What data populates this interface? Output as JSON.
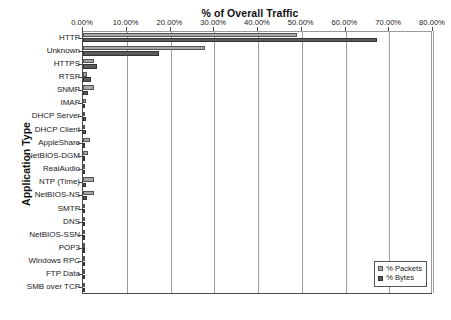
{
  "chart_data": {
    "type": "bar",
    "orientation": "horizontal",
    "title": "% of Overall Traffic",
    "xlabel": "% of Overall Traffic",
    "ylabel": "Application Type",
    "xlim": [
      0,
      80
    ],
    "grid": true,
    "legend_position": "bottom-right",
    "xtick_labels": [
      "0.00%",
      "10.00%",
      "20.00%",
      "30.00%",
      "40.00%",
      "50.00%",
      "60.00%",
      "70.00%",
      "80.00%"
    ],
    "xtick_values": [
      0,
      10,
      20,
      30,
      40,
      50,
      60,
      70,
      80
    ],
    "categories": [
      "HTTP",
      "Unknown",
      "HTTPS",
      "RTSP",
      "SNMP",
      "IMAP",
      "DHCP Server",
      "DHCP Client",
      "AppleShare",
      "NetBIOS-DGM",
      "RealAudio",
      "NTP (Time)",
      "NetBIOS-NS",
      "SMTP",
      "DNS",
      "NetBIOS-SSN",
      "POP3",
      "Windows RPC",
      "FTP Data",
      "SMB over TCP"
    ],
    "series": [
      {
        "name": "% Packets",
        "color": "#a8a8a8",
        "values": [
          48.8,
          27.8,
          2.6,
          0.9,
          2.4,
          0.7,
          0.5,
          0.5,
          1.6,
          1.1,
          0.4,
          2.4,
          2.6,
          0.3,
          0.3,
          0.2,
          0.2,
          0.2,
          0.15,
          0.15
        ]
      },
      {
        "name": "% Bytes",
        "color": "#5c5c5c",
        "values": [
          67.1,
          17.4,
          3.1,
          1.8,
          1.1,
          0.4,
          0.6,
          0.6,
          0.5,
          0.4,
          0.3,
          0.6,
          0.8,
          0.3,
          0.5,
          0.3,
          0.2,
          0.4,
          0.2,
          0.2
        ]
      }
    ],
    "legend": [
      "% Packets",
      "% Bytes"
    ]
  }
}
